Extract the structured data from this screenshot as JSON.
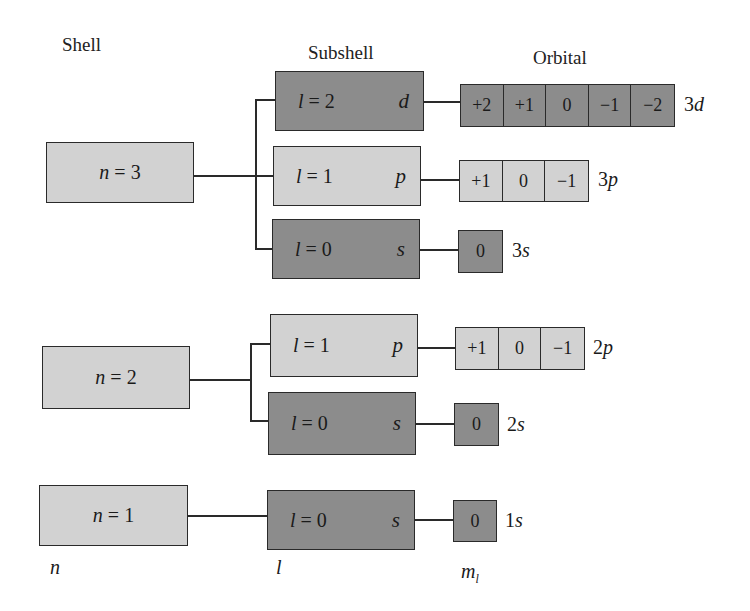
{
  "headers": {
    "shell": "Shell",
    "subshell": "Subshell",
    "orbital": "Orbital"
  },
  "colors": {
    "light_fill": "#d2d2d2",
    "dark_fill": "#8c8c8c",
    "stroke": "#2a2a2a"
  },
  "shells": [
    {
      "var": "n",
      "eq": " = ",
      "value": "3",
      "subshells": [
        {
          "var": "l",
          "eq": " = ",
          "value": "2",
          "letter": "d",
          "shade": "dark",
          "orbitals": [
            "+2",
            "+1",
            "0",
            "−1",
            "−2"
          ],
          "label_num": "3",
          "label_letter": "d"
        },
        {
          "var": "l",
          "eq": " = ",
          "value": "1",
          "letter": "p",
          "shade": "light",
          "orbitals": [
            "+1",
            "0",
            "−1"
          ],
          "label_num": "3",
          "label_letter": "p"
        },
        {
          "var": "l",
          "eq": " = ",
          "value": "0",
          "letter": "s",
          "shade": "dark",
          "orbitals": [
            "0"
          ],
          "label_num": "3",
          "label_letter": "s"
        }
      ]
    },
    {
      "var": "n",
      "eq": " = ",
      "value": "2",
      "subshells": [
        {
          "var": "l",
          "eq": " = ",
          "value": "1",
          "letter": "p",
          "shade": "light",
          "orbitals": [
            "+1",
            "0",
            "−1"
          ],
          "label_num": "2",
          "label_letter": "p"
        },
        {
          "var": "l",
          "eq": " = ",
          "value": "0",
          "letter": "s",
          "shade": "dark",
          "orbitals": [
            "0"
          ],
          "label_num": "2",
          "label_letter": "s"
        }
      ]
    },
    {
      "var": "n",
      "eq": " = ",
      "value": "1",
      "subshells": [
        {
          "var": "l",
          "eq": " = ",
          "value": "0",
          "letter": "s",
          "shade": "dark",
          "orbitals": [
            "0"
          ],
          "label_num": "1",
          "label_letter": "s"
        }
      ]
    }
  ],
  "axis_labels": {
    "shell": "n",
    "subshell": "l",
    "orbital_main": "m",
    "orbital_sub": "l"
  }
}
